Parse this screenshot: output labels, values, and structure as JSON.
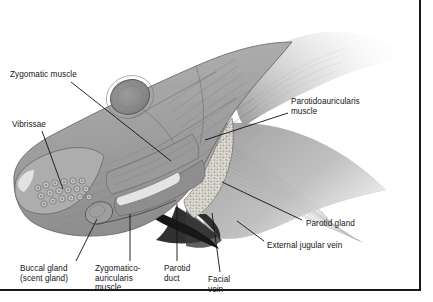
{
  "figure": {
    "style": "grayscale anatomical illustration with leader-line callouts"
  },
  "frame": {
    "name": "figure-border",
    "color": "#1a1a1a",
    "width_px": 2
  },
  "palette": {
    "background": "#ffffff",
    "muscle_light": "#b9b9b9",
    "muscle_mid": "#9c9c9c",
    "muscle_dark": "#787878",
    "muscle_deep": "#5c5c5c",
    "eye": "#8a8a8a",
    "gland_light": "#dcd9d2",
    "vein_dark": "#2b2b2b",
    "outline": "#4a4a4a",
    "label_text": "#141414",
    "leader_line": "#111111"
  },
  "labels": [
    {
      "id": "zygomatic-muscle",
      "text": "Zygomatic muscle",
      "lines": [
        "Zygomatic muscle"
      ],
      "x": 10,
      "y": 70,
      "align": "left",
      "leader": {
        "x1": 71,
        "y1": 82,
        "x2": 171,
        "y2": 161
      }
    },
    {
      "id": "vibrissae",
      "text": "Vibrissae",
      "lines": [
        "Vibrissae"
      ],
      "x": 12,
      "y": 120,
      "align": "left",
      "leader": {
        "x1": 42,
        "y1": 131,
        "x2": 63,
        "y2": 189
      }
    },
    {
      "id": "buccal-gland",
      "text": "Buccal gland (scent gland)",
      "lines": [
        "Buccal gland",
        "(scent gland)"
      ],
      "x": 20,
      "y": 264,
      "align": "left",
      "leader": {
        "x1": 76,
        "y1": 261,
        "x2": 97,
        "y2": 219
      }
    },
    {
      "id": "zygomatico-auricularis-muscle",
      "text": "Zygomatico-auricularis muscle",
      "lines": [
        "Zygomatico-",
        "auricularis",
        "muscle"
      ],
      "x": 95,
      "y": 264,
      "align": "left",
      "leader": {
        "x1": 130,
        "y1": 261,
        "x2": 130,
        "y2": 214
      }
    },
    {
      "id": "parotid-duct",
      "text": "Parotid duct",
      "lines": [
        "Parotid",
        "duct"
      ],
      "x": 164,
      "y": 264,
      "align": "left",
      "leader": {
        "x1": 177,
        "y1": 261,
        "x2": 177,
        "y2": 204
      }
    },
    {
      "id": "facial-vein",
      "text": "Facial vein",
      "lines": [
        "Facial",
        "vein"
      ],
      "x": 208,
      "y": 275,
      "align": "left",
      "leader": {
        "x1": 220,
        "y1": 272,
        "x2": 212,
        "y2": 213
      }
    },
    {
      "id": "parotidoauricularis-muscle",
      "text": "Parotidoauricularis muscle",
      "lines": [
        "Parotidoauricularis",
        "muscle"
      ],
      "x": 291,
      "y": 97,
      "align": "left",
      "leader": {
        "x1": 288,
        "y1": 113,
        "x2": 205,
        "y2": 140
      }
    },
    {
      "id": "parotid-gland",
      "text": "Parotid gland",
      "lines": [
        "Parotid gland"
      ],
      "x": 306,
      "y": 219,
      "align": "left",
      "leader": {
        "x1": 302,
        "y1": 220,
        "x2": 222,
        "y2": 182
      }
    },
    {
      "id": "external-jugular-vein",
      "text": "External jugular vein",
      "lines": [
        "External jugular vein"
      ],
      "x": 267,
      "y": 241,
      "align": "left",
      "leader": {
        "x1": 264,
        "y1": 241,
        "x2": 237,
        "y2": 221
      }
    }
  ]
}
